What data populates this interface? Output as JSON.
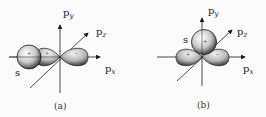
{
  "panels": [
    {
      "id": "a",
      "caption": "(a)",
      "axes": {
        "y_label": "p",
        "y_sub": "y",
        "z_label": "p",
        "z_sub": "z",
        "x_label": "p",
        "x_sub": "x"
      },
      "orbital_label": "s",
      "signs": [
        "+",
        "+",
        "−"
      ],
      "description": "s orbital overlapping along the p_x axis"
    },
    {
      "id": "b",
      "caption": "(b)",
      "axes": {
        "y_label": "p",
        "y_sub": "y",
        "z_label": "p",
        "z_sub": "z",
        "x_label": "p",
        "x_sub": "x"
      },
      "orbital_label": "s",
      "signs": [
        "+",
        "+",
        "−"
      ],
      "description": "s orbital above the p_x orbital (perpendicular, along p_y)"
    }
  ],
  "colors": {
    "stroke": "#1a1a1a",
    "lobe_light": "#eeeeee",
    "lobe_dark": "#4a4a4a",
    "background": "#fbfbfb"
  }
}
